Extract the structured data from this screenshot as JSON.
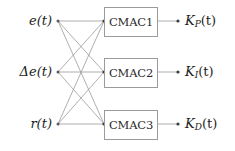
{
  "diagram": {
    "type": "block-diagram",
    "canvas": {
      "width": 235,
      "height": 151,
      "background": "#ffffff"
    },
    "colors": {
      "line": "#9b9b9b",
      "box_border": "#9b9b9b",
      "box_fill": "#ffffff",
      "text": "#1d1d1d",
      "node_dot": "#5a5a5a"
    },
    "inputs": [
      {
        "id": "e",
        "label": "e(t)",
        "x": 58,
        "y": 21
      },
      {
        "id": "delta_e",
        "label": "Δe(t)",
        "x": 58,
        "y": 72
      },
      {
        "id": "r",
        "label": "r(t)",
        "x": 58,
        "y": 124
      }
    ],
    "blocks": [
      {
        "id": "cmac1",
        "label": "CMAC1",
        "x": 104,
        "y": 7,
        "w": 54,
        "h": 30
      },
      {
        "id": "cmac2",
        "label": "CMAC2",
        "x": 104,
        "y": 58,
        "w": 54,
        "h": 30
      },
      {
        "id": "cmac3",
        "label": "CMAC3",
        "x": 104,
        "y": 110,
        "w": 54,
        "h": 30
      }
    ],
    "outputs": [
      {
        "id": "kp",
        "base": "K",
        "sub": "P",
        "arg": "(t)",
        "label": "K_P(t)",
        "x": 185,
        "y": 21
      },
      {
        "id": "ki",
        "base": "K",
        "sub": "I",
        "arg": "(t)",
        "label": "K_I(t)",
        "x": 185,
        "y": 72
      },
      {
        "id": "kd",
        "base": "K",
        "sub": "D",
        "arg": "(t)",
        "label": "K_D(t)",
        "x": 185,
        "y": 124
      }
    ],
    "connections": [
      {
        "from": "e",
        "to": "cmac1"
      },
      {
        "from": "e",
        "to": "cmac2"
      },
      {
        "from": "e",
        "to": "cmac3"
      },
      {
        "from": "delta_e",
        "to": "cmac1"
      },
      {
        "from": "delta_e",
        "to": "cmac2"
      },
      {
        "from": "delta_e",
        "to": "cmac3"
      },
      {
        "from": "r",
        "to": "cmac1"
      },
      {
        "from": "r",
        "to": "cmac2"
      },
      {
        "from": "r",
        "to": "cmac3"
      },
      {
        "from": "cmac1",
        "to": "kp"
      },
      {
        "from": "cmac2",
        "to": "ki"
      },
      {
        "from": "cmac3",
        "to": "kd"
      }
    ]
  }
}
